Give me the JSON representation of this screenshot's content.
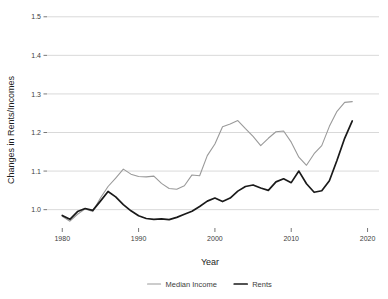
{
  "chart_data": {
    "type": "line",
    "title": "",
    "xlabel": "Year",
    "ylabel": "Changes in Rents/Incomes",
    "xlim": [
      1978.0,
      2021.5
    ],
    "ylim": [
      0.955,
      1.515
    ],
    "xticks": [
      1980,
      1990,
      2000,
      2010,
      2020
    ],
    "xtick_labels": [
      "1980",
      "1990",
      "2000",
      "2010",
      "2020"
    ],
    "yticks": [
      1.0,
      1.1,
      1.2,
      1.3,
      1.4,
      1.5
    ],
    "ytick_labels": [
      "1.0",
      "1.1",
      "1.2",
      "1.3",
      "1.4",
      "1.5"
    ],
    "grid": true,
    "grid_axis": "y",
    "grid_color": "#c9c9c9",
    "legend_position": "bottom-center",
    "x": [
      1980,
      1981,
      1982,
      1983,
      1984,
      1985,
      1986,
      1987,
      1988,
      1989,
      1990,
      1991,
      1992,
      1993,
      1994,
      1995,
      1996,
      1997,
      1998,
      1999,
      2000,
      2001,
      2002,
      2003,
      2004,
      2005,
      2006,
      2007,
      2008,
      2009,
      2010,
      2011,
      2012,
      2013,
      2014,
      2015,
      2016,
      2017,
      2018
    ],
    "series": [
      {
        "name": "Median Income",
        "color": "#9a9a9a",
        "width": 1.1,
        "values": [
          0.983,
          0.97,
          0.988,
          1.002,
          0.995,
          1.03,
          1.06,
          1.082,
          1.105,
          1.092,
          1.086,
          1.085,
          1.087,
          1.068,
          1.055,
          1.053,
          1.062,
          1.09,
          1.088,
          1.14,
          1.17,
          1.215,
          1.222,
          1.231,
          1.21,
          1.19,
          1.166,
          1.185,
          1.202,
          1.204,
          1.175,
          1.136,
          1.115,
          1.145,
          1.166,
          1.216,
          1.255,
          1.278,
          1.28
        ]
      },
      {
        "name": "Rents",
        "color": "#1a1a1a",
        "width": 1.7,
        "values": [
          0.985,
          0.975,
          0.995,
          1.003,
          0.998,
          1.022,
          1.047,
          1.033,
          1.013,
          0.997,
          0.984,
          0.977,
          0.975,
          0.976,
          0.974,
          0.98,
          0.988,
          0.996,
          1.008,
          1.022,
          1.03,
          1.021,
          1.03,
          1.048,
          1.06,
          1.064,
          1.056,
          1.05,
          1.072,
          1.08,
          1.07,
          1.1,
          1.067,
          1.045,
          1.049,
          1.075,
          1.128,
          1.185,
          1.23
        ]
      }
    ]
  },
  "legend": {
    "items": [
      {
        "label": "Median Income",
        "color": "#9a9a9a"
      },
      {
        "label": "Rents",
        "color": "#1a1a1a"
      }
    ]
  }
}
